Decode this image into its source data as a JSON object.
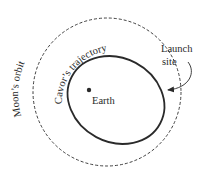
{
  "diagram": {
    "type": "orbital-diagram",
    "labels": {
      "moon_orbit": "Moon’s orbit",
      "trajectory": "Cavor’s trajectory",
      "earth": "Earth",
      "launch_line1": "Launch",
      "launch_line2": "site"
    },
    "elements": [
      {
        "name": "moon-orbit",
        "shape": "circle",
        "style": "dashed"
      },
      {
        "name": "cavor-trajectory",
        "shape": "ellipse",
        "style": "solid-bold"
      },
      {
        "name": "earth",
        "shape": "dot"
      },
      {
        "name": "launch-site-arrow",
        "shape": "curved-arrow"
      }
    ],
    "colors": {
      "stroke": "#2a2a2a",
      "background": "#ffffff"
    }
  }
}
